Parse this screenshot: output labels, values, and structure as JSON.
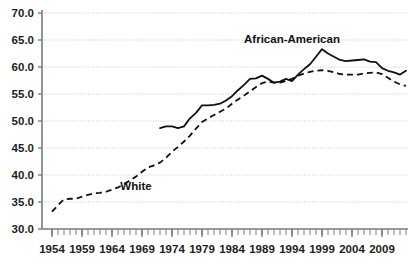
{
  "chart_data": {
    "type": "line",
    "title": "",
    "xlabel": "",
    "ylabel": "",
    "xlim": [
      1954,
      2013
    ],
    "ylim": [
      30.0,
      70.0
    ],
    "grid": true,
    "legend_position": "inline-annotations",
    "y_ticks": [
      "70.0",
      "65.0",
      "60.0",
      "55.0",
      "50.0",
      "45.0",
      "40.0",
      "35.0",
      "30.0"
    ],
    "y_tick_values": [
      70.0,
      65.0,
      60.0,
      55.0,
      50.0,
      45.0,
      40.0,
      35.0,
      30.0
    ],
    "x_ticks": [
      "1954",
      "1959",
      "1964",
      "1969",
      "1974",
      "1979",
      "1984",
      "1989",
      "1994",
      "1999",
      "2004",
      "2009"
    ],
    "x_tick_values": [
      1954,
      1959,
      1964,
      1969,
      1974,
      1979,
      1984,
      1989,
      1994,
      1999,
      2004,
      2009
    ],
    "x_minor_tick_interval": 1,
    "annotations": [
      {
        "text": "African-American",
        "x": 1994,
        "y": 64.5
      },
      {
        "text": "White",
        "x": 1968,
        "y": 37.2
      }
    ],
    "series": [
      {
        "name": "African-American",
        "style": "solid",
        "x": [
          1972,
          1973,
          1974,
          1975,
          1976,
          1977,
          1978,
          1979,
          1980,
          1981,
          1982,
          1983,
          1984,
          1985,
          1986,
          1987,
          1988,
          1989,
          1990,
          1991,
          1992,
          1993,
          1994,
          1995,
          1996,
          1997,
          1998,
          1999,
          2000,
          2001,
          2002,
          2003,
          2004,
          2005,
          2006,
          2007,
          2008,
          2009,
          2010,
          2011,
          2012,
          2013
        ],
        "values": [
          48.7,
          49.0,
          49.0,
          48.7,
          49.0,
          50.5,
          51.5,
          52.9,
          52.9,
          53.0,
          53.2,
          53.8,
          54.6,
          55.7,
          56.7,
          57.8,
          57.9,
          58.4,
          57.8,
          57.1,
          57.3,
          57.8,
          57.4,
          58.6,
          59.6,
          60.5,
          61.9,
          63.3,
          62.5,
          61.9,
          61.3,
          61.1,
          61.2,
          61.3,
          61.4,
          61.0,
          60.9,
          59.8,
          59.3,
          59.0,
          58.6,
          59.3
        ]
      },
      {
        "name": "White",
        "style": "dashed",
        "x": [
          1954,
          1955,
          1956,
          1957,
          1958,
          1959,
          1960,
          1961,
          1962,
          1963,
          1964,
          1965,
          1966,
          1967,
          1968,
          1969,
          1970,
          1971,
          1972,
          1973,
          1974,
          1975,
          1976,
          1977,
          1978,
          1979,
          1980,
          1981,
          1982,
          1983,
          1984,
          1985,
          1986,
          1987,
          1988,
          1989,
          1990,
          1991,
          1992,
          1993,
          1994,
          1995,
          1996,
          1997,
          1998,
          1999,
          2000,
          2001,
          2002,
          2003,
          2004,
          2005,
          2006,
          2007,
          2008,
          2009,
          2010,
          2011,
          2012,
          2013
        ],
        "values": [
          33.2,
          34.4,
          35.5,
          35.6,
          35.6,
          36.0,
          36.3,
          36.6,
          36.7,
          36.9,
          37.3,
          37.7,
          38.3,
          39.0,
          39.7,
          40.6,
          41.4,
          41.8,
          42.3,
          43.2,
          44.3,
          45.2,
          46.2,
          47.3,
          48.6,
          49.8,
          50.5,
          51.1,
          51.7,
          52.3,
          53.2,
          54.0,
          54.7,
          55.5,
          56.3,
          57.0,
          57.3,
          57.1,
          57.1,
          57.4,
          57.8,
          58.4,
          58.8,
          59.1,
          59.3,
          59.4,
          59.3,
          59.0,
          58.7,
          58.6,
          58.6,
          58.6,
          58.8,
          58.9,
          59.0,
          58.7,
          58.0,
          57.3,
          56.8,
          56.5
        ]
      }
    ]
  },
  "axes": {
    "y_axis_name": "value-axis",
    "x_axis_name": "year-axis"
  }
}
